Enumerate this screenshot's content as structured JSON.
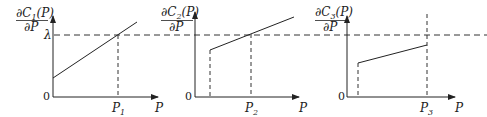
{
  "diagram": {
    "lambda_label": "λ",
    "panels": [
      {
        "y_label_num": "∂C1(P)",
        "y_label_num_main": "∂C",
        "y_label_num_sub": "1",
        "y_label_num_tail": "(P)",
        "y_label_den": "∂P",
        "origin": "0",
        "x_label": "P",
        "tick_label_main": "P",
        "tick_label_sub": "1",
        "description": "Linear increasing incremental cost starting from y-axis; crosses λ at P1"
      },
      {
        "y_label_num": "∂C2(P)",
        "y_label_num_main": "∂C",
        "y_label_num_sub": "2",
        "y_label_num_tail": "(P)",
        "y_label_den": "∂P",
        "origin": "0",
        "x_label": "P",
        "tick_label_main": "P",
        "tick_label_sub": "2",
        "description": "Incremental cost starting at a minimum output; crosses λ at P2"
      },
      {
        "y_label_num": "∂C3(P)",
        "y_label_num_main": "∂C",
        "y_label_num_sub": "3",
        "y_label_num_tail": "(P)",
        "y_label_den": "∂P",
        "origin": "0",
        "x_label": "P",
        "tick_label_main": "P",
        "tick_label_sub": "3",
        "description": "Incremental cost stays below λ up to max output P3"
      }
    ]
  }
}
